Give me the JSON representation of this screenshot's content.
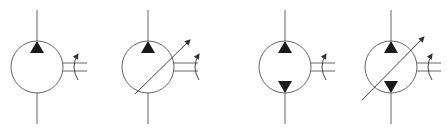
{
  "diagram": {
    "title": "Hydraulic motor symbols",
    "stroke_color": "#555555",
    "fill_color": "#1a1a1a",
    "symbols": [
      {
        "label": "Fixed displacement motor, one direction of flow",
        "cx": 37,
        "cy": 67,
        "r": 26,
        "variable": false,
        "bidirectional": false
      },
      {
        "label": "Variable displacement motor, one direction of flow",
        "cx": 148,
        "cy": 67,
        "r": 26,
        "variable": true,
        "bidirectional": false
      },
      {
        "label": "Fixed displacement motor, two directions of flow",
        "cx": 285,
        "cy": 67,
        "r": 26,
        "variable": false,
        "bidirectional": true
      },
      {
        "label": "Variable displacement motor, two directions of flow",
        "cx": 391,
        "cy": 67,
        "r": 26,
        "variable": true,
        "bidirectional": true
      }
    ]
  }
}
